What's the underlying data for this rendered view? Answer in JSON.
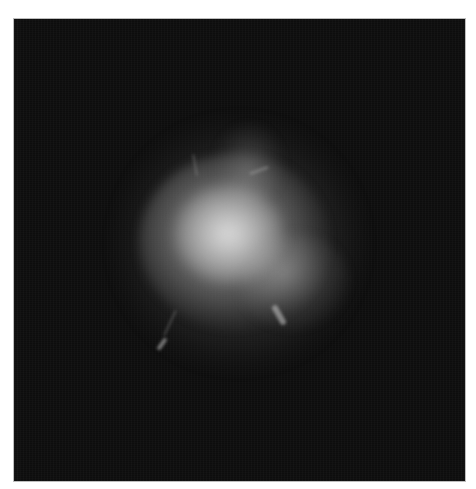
{
  "image": {
    "description": "Bright diffuse cloud-like structure on a black background",
    "background_color": "#0d0d0d",
    "border_color": "#bdbdbd",
    "page_background": "#ffffff",
    "highlight_color": "#e1e1e1"
  }
}
